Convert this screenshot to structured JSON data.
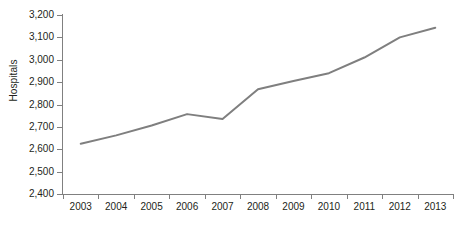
{
  "chart_data": {
    "type": "line",
    "title": "",
    "subtitle": "",
    "xlabel": "",
    "ylabel": "Hospitals",
    "categories": [
      "2003",
      "2004",
      "2005",
      "2006",
      "2007",
      "2008",
      "2009",
      "2010",
      "2011",
      "2012",
      "2013"
    ],
    "x": [
      2003,
      2004,
      2005,
      2006,
      2007,
      2008,
      2009,
      2010,
      2011,
      2012,
      2013
    ],
    "series": [
      {
        "name": "Hospitals",
        "color": "#7f7f7f",
        "values": [
          2625,
          2662,
          2706,
          2757,
          2735,
          2868,
          2905,
          2940,
          3010,
          3100,
          3143
        ]
      }
    ],
    "ylim": [
      2400,
      3200
    ],
    "ytick_step": 100,
    "ytick_labels": [
      "2,400",
      "2,500",
      "2,600",
      "2,700",
      "2,800",
      "2,900",
      "3,000",
      "3,100",
      "3,200"
    ],
    "ytick_values": [
      2400,
      2500,
      2600,
      2700,
      2800,
      2900,
      3000,
      3100,
      3200
    ],
    "grid": false,
    "legend": "none",
    "markers": false,
    "line_width": 2,
    "axis_color": "#808080",
    "text_color": "#231f20",
    "background": "#ffffff"
  }
}
